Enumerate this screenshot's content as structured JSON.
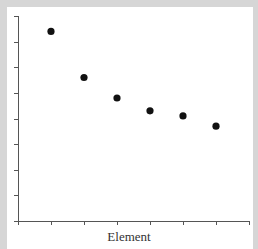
{
  "chart_data": {
    "type": "scatter",
    "title": "",
    "xlabel": "Element",
    "ylabel": "",
    "x": [
      1,
      2,
      3,
      4,
      5,
      6
    ],
    "values": [
      7.4,
      5.6,
      4.8,
      4.3,
      4.1,
      3.7
    ],
    "xlim": [
      0,
      7
    ],
    "ylim": [
      0,
      8
    ],
    "x_ticks": 8,
    "y_ticks": 9,
    "tick_labels_visible": false,
    "grid": false,
    "legend": null,
    "marker_color": "#111111"
  },
  "axes": {
    "xlabel": "Element"
  }
}
